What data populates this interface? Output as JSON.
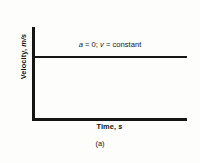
{
  "figure": {
    "caption": "(a)",
    "annotation": {
      "full": "a = 0; v = constant",
      "acceleration_symbol": "a",
      "acceleration_expr": " = 0; ",
      "velocity_symbol": "v",
      "velocity_expr": " = constant"
    },
    "axes": {
      "y_label_name": "Velocity,",
      "y_label_unit": "m/s",
      "y_label_full": "Velocity, m/s",
      "x_label_name": "Time,",
      "x_label_unit": "s",
      "x_label_full": "Time, s"
    },
    "colors": {
      "ink": "#151515",
      "background": "#fdfdfc"
    }
  },
  "chart_data": {
    "type": "line",
    "title": "",
    "subtitle": "",
    "xlabel": "Time, s",
    "ylabel": "Velocity, m/s",
    "xlim": [
      0,
      1
    ],
    "ylim": [
      0,
      1
    ],
    "grid": false,
    "legend": null,
    "tick_labels": {
      "x": [],
      "y": []
    },
    "annotations": [
      {
        "text": "a = 0; v = constant",
        "x": 0.5,
        "y": 0.78,
        "align": "center"
      }
    ],
    "series": [
      {
        "name": "velocity",
        "x": [
          0,
          1
        ],
        "values": [
          0.66,
          0.66
        ],
        "description": "Constant velocity: horizontal line, zero slope, zero acceleration"
      }
    ]
  }
}
